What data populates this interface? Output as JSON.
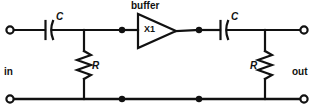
{
  "diagram": {
    "type": "schematic",
    "width": 314,
    "height": 112,
    "ink_color": "#111111",
    "background_color": "#ffffff",
    "labels": {
      "buffer": "buffer",
      "amplifier_ref": "X1",
      "cap_in": "C",
      "cap_out": "C",
      "res_in": "R",
      "res_out": "R",
      "port_in": "in",
      "port_out": "out"
    },
    "components": [
      {
        "name": "input-capacitor",
        "designator": "C",
        "kind": "capacitor",
        "x": 49,
        "y": 30
      },
      {
        "name": "input-resistor",
        "designator": "R",
        "kind": "resistor",
        "x": 84,
        "y": 67
      },
      {
        "name": "buffer-amplifier",
        "designator": "X1",
        "kind": "buffer",
        "x": 157,
        "y": 31
      },
      {
        "name": "output-capacitor",
        "designator": "C",
        "kind": "capacitor",
        "x": 224,
        "y": 30
      },
      {
        "name": "output-resistor",
        "designator": "R",
        "kind": "resistor",
        "x": 265,
        "y": 67
      }
    ],
    "terminals": [
      {
        "name": "input-terminal",
        "label": "in",
        "x": 10,
        "y": 30
      },
      {
        "name": "input-ground-terminal",
        "label": "in",
        "x": 10,
        "y": 99
      },
      {
        "name": "output-terminal",
        "label": "out",
        "x": 304,
        "y": 30
      },
      {
        "name": "output-ground-terminal",
        "label": "out",
        "x": 304,
        "y": 99
      }
    ],
    "junction_dots": [
      {
        "name": "junction-input-node",
        "x": 122,
        "y": 30
      },
      {
        "name": "junction-output-node",
        "x": 199,
        "y": 30
      },
      {
        "name": "junction-ground-left",
        "x": 122,
        "y": 99
      },
      {
        "name": "junction-ground-right",
        "x": 199,
        "y": 99
      }
    ]
  }
}
